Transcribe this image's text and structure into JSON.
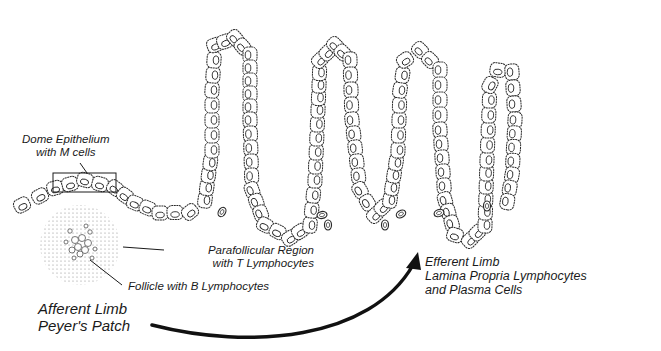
{
  "diagram": {
    "labels": {
      "dome": {
        "line1": "Dome Epithelium",
        "line2": "with M cells"
      },
      "parafollicular": {
        "line1": "Parafollicular Region",
        "line2": "with T Lymphocytes"
      },
      "follicle": {
        "line1": "Follicle with B Lymphocytes"
      },
      "afferent": {
        "line1": "Afferent Limb",
        "line2": "Peyer's Patch"
      },
      "efferent": {
        "line1": "Efferent Limb",
        "line2": "Lamina Propria Lymphocytes",
        "line3": "and Plasma Cells"
      }
    },
    "colors": {
      "ink": "#1a1a1a",
      "background": "#ffffff",
      "cell_fill": "#ffffff",
      "stipple": "#8a8a8a"
    }
  }
}
